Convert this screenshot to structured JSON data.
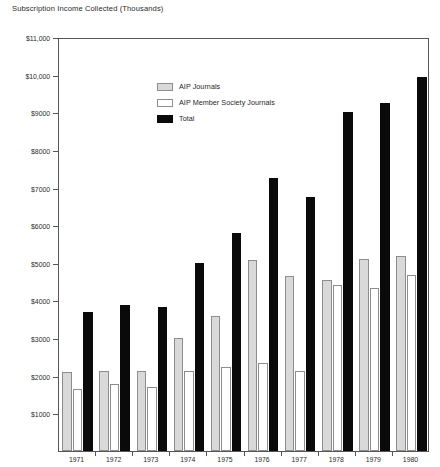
{
  "chart_data": {
    "type": "bar",
    "title": "Subscription Income Collected (Thousands)",
    "title_lines": [
      "Subscription Income",
      "Collected (Thousands)"
    ],
    "xlabel": "",
    "ylabel": "Subscription Income Collected (Thousands)",
    "grid": false,
    "legend_position": "top-left inside plot",
    "ylim": [
      0,
      11000
    ],
    "ytick_step": 1000,
    "categories": [
      "1971",
      "1972",
      "1973",
      "1974",
      "1975",
      "1976",
      "1977",
      "1978",
      "1979",
      "1980"
    ],
    "ytick_labels": [
      "$1000",
      "$2000",
      "$3000",
      "$4000",
      "$5000",
      "$6000",
      "$7000",
      "$8000",
      "$9000",
      "$10,000",
      "$11,000"
    ],
    "ytick_values": [
      1000,
      2000,
      3000,
      4000,
      5000,
      6000,
      7000,
      8000,
      9000,
      10000,
      11000
    ],
    "series": [
      {
        "name": "AIP Journals",
        "color": "#d9d9d9",
        "edge": "#8d8d8d",
        "values": [
          2100,
          2120,
          2130,
          3000,
          3580,
          5080,
          4650,
          4550,
          5100,
          5170
        ]
      },
      {
        "name": "AIP Member Society Journals",
        "color": "#ffffff",
        "edge": "#8d8d8d",
        "values": [
          1650,
          1780,
          1700,
          2130,
          2220,
          2350,
          2130,
          4400,
          4330,
          4680
        ]
      },
      {
        "name": "Total",
        "color": "#0a0a0a",
        "edge": "#0a0a0a",
        "values": [
          3700,
          3880,
          3820,
          5000,
          5780,
          7250,
          6750,
          9000,
          9250,
          9950
        ]
      }
    ]
  },
  "legend": {
    "items": [
      {
        "label": "AIP Journals",
        "swatch": "aip"
      },
      {
        "label": "AIP Member Society Journals",
        "swatch": "member"
      },
      {
        "label": "Total",
        "swatch": "total"
      }
    ]
  }
}
